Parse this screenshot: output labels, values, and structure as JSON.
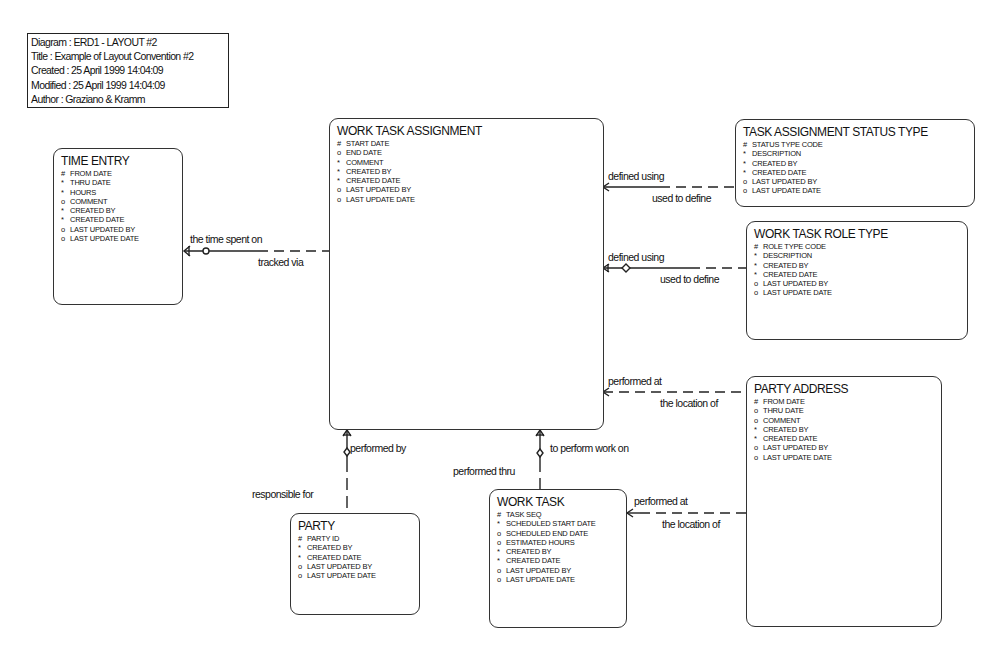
{
  "legend": {
    "diagram": "Diagram : ERD1 - LAYOUT #2",
    "title": "Title : Example of Layout Convention #2",
    "created": "Created : 25 April     1999 14:04:09",
    "modified": "Modified : 25 April     1999 14:04:09",
    "author": "Author : Graziano & Kramm"
  },
  "entities": {
    "time_entry": {
      "title": "TIME ENTRY",
      "attrs": [
        {
          "mark": "#",
          "name": "FROM DATE"
        },
        {
          "mark": "*",
          "name": "THRU DATE"
        },
        {
          "mark": "*",
          "name": "HOURS"
        },
        {
          "mark": "o",
          "name": "COMMENT"
        },
        {
          "mark": "*",
          "name": "CREATED BY"
        },
        {
          "mark": "*",
          "name": "CREATED DATE"
        },
        {
          "mark": "o",
          "name": "LAST UPDATED BY"
        },
        {
          "mark": "o",
          "name": "LAST UPDATE DATE"
        }
      ]
    },
    "work_task_assignment": {
      "title": "WORK TASK ASSIGNMENT",
      "attrs": [
        {
          "mark": "#",
          "name": "START DATE"
        },
        {
          "mark": "o",
          "name": "END DATE"
        },
        {
          "mark": "*",
          "name": "COMMENT"
        },
        {
          "mark": "*",
          "name": "CREATED BY"
        },
        {
          "mark": "*",
          "name": "CREATED DATE"
        },
        {
          "mark": "o",
          "name": "LAST UPDATED BY"
        },
        {
          "mark": "o",
          "name": "LAST UPDATE DATE"
        }
      ]
    },
    "task_assignment_status_type": {
      "title": "TASK ASSIGNMENT STATUS TYPE",
      "attrs": [
        {
          "mark": "#",
          "name": "STATUS TYPE CODE"
        },
        {
          "mark": "*",
          "name": "DESCRIPTION"
        },
        {
          "mark": "*",
          "name": "CREATED BY"
        },
        {
          "mark": "*",
          "name": "CREATED DATE"
        },
        {
          "mark": "o",
          "name": "LAST UPDATED BY"
        },
        {
          "mark": "o",
          "name": "LAST UPDATE DATE"
        }
      ]
    },
    "work_task_role_type": {
      "title": "WORK TASK ROLE TYPE",
      "attrs": [
        {
          "mark": "#",
          "name": "ROLE TYPE CODE"
        },
        {
          "mark": "*",
          "name": "DESCRIPTION"
        },
        {
          "mark": "*",
          "name": "CREATED BY"
        },
        {
          "mark": "*",
          "name": "CREATED DATE"
        },
        {
          "mark": "o",
          "name": "LAST UPDATED BY"
        },
        {
          "mark": "o",
          "name": "LAST UPDATE DATE"
        }
      ]
    },
    "party_address": {
      "title": "PARTY ADDRESS",
      "attrs": [
        {
          "mark": "#",
          "name": "FROM DATE"
        },
        {
          "mark": "o",
          "name": "THRU DATE"
        },
        {
          "mark": "o",
          "name": "COMMENT"
        },
        {
          "mark": "*",
          "name": "CREATED BY"
        },
        {
          "mark": "*",
          "name": "CREATED DATE"
        },
        {
          "mark": "o",
          "name": "LAST UPDATED BY"
        },
        {
          "mark": "o",
          "name": "LAST UPDATE DATE"
        }
      ]
    },
    "party": {
      "title": "PARTY",
      "attrs": [
        {
          "mark": "#",
          "name": "PARTY ID"
        },
        {
          "mark": "*",
          "name": "CREATED BY"
        },
        {
          "mark": "*",
          "name": "CREATED DATE"
        },
        {
          "mark": "o",
          "name": "LAST UPDATED BY"
        },
        {
          "mark": "o",
          "name": "LAST UPDATE DATE"
        }
      ]
    },
    "work_task": {
      "title": "WORK TASK",
      "attrs": [
        {
          "mark": "#",
          "name": "TASK SEQ"
        },
        {
          "mark": "*",
          "name": "SCHEDULED START DATE"
        },
        {
          "mark": "o",
          "name": "SCHEDULED END DATE"
        },
        {
          "mark": "o",
          "name": "ESTIMATED HOURS"
        },
        {
          "mark": "*",
          "name": "CREATED BY"
        },
        {
          "mark": "*",
          "name": "CREATED DATE"
        },
        {
          "mark": "o",
          "name": "LAST UPDATED BY"
        },
        {
          "mark": "o",
          "name": "LAST UPDATE DATE"
        }
      ]
    }
  },
  "relationships": {
    "status_defined_using": "defined using",
    "status_used_to_define": "used to define",
    "role_defined_using": "defined using",
    "role_used_to_define": "used to define",
    "time_spent_on": "the time spent on",
    "tracked_via": "tracked via",
    "address_performed_at": "performed at",
    "address_location_of": "the location of",
    "party_performed_by": "performed by",
    "party_responsible_for": "responsible for",
    "task_to_perform_work_on": "to perform work on",
    "task_performed_thru": "performed thru",
    "worktask_performed_at": "performed at",
    "worktask_location_of": "the location of"
  }
}
